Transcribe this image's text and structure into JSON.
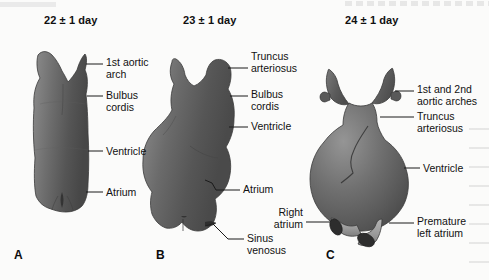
{
  "figure": {
    "background_color": "#fbfbfa",
    "ink_color": "#111111",
    "organ_dark": "#4a4a4a",
    "organ_mid": "#6f6f6f",
    "organ_light": "#9a9a9a",
    "tube_light": "#a8a8a8"
  },
  "panels": [
    {
      "letter": "A",
      "title": "22 ± 1 day",
      "labels": [
        {
          "name": "first-aortic-arch",
          "text": "1st aortic\narch"
        },
        {
          "name": "bulbus-cordis",
          "text": "Bulbus\ncordis"
        },
        {
          "name": "ventricle",
          "text": "Ventricle"
        },
        {
          "name": "atrium",
          "text": "Atrium"
        }
      ]
    },
    {
      "letter": "B",
      "title": "23 ± 1 day",
      "labels": [
        {
          "name": "truncus-arteriosus",
          "text": "Truncus\narteriosus"
        },
        {
          "name": "bulbus-cordis",
          "text": "Bulbus\ncordis"
        },
        {
          "name": "ventricle",
          "text": "Ventricle"
        },
        {
          "name": "atrium",
          "text": "Atrium"
        },
        {
          "name": "sinus-venosus",
          "text": "Sinus\nvenosus"
        }
      ]
    },
    {
      "letter": "C",
      "title": "24 ± 1 day",
      "labels": [
        {
          "name": "first-and-second-aortic-arches",
          "text": "1st and 2nd\naortic arches"
        },
        {
          "name": "truncus-arteriosus",
          "text": "Truncus\narteriosus"
        },
        {
          "name": "ventricle",
          "text": "Ventricle"
        },
        {
          "name": "right-atrium",
          "text": "Right\natrium"
        },
        {
          "name": "premature-left-atrium",
          "text": "Premature\nleft atrium"
        }
      ]
    }
  ]
}
